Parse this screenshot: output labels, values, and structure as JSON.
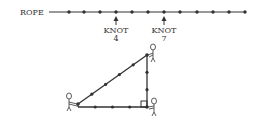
{
  "rope": {
    "label": "ROPE",
    "knot_count": 12,
    "knots_x": [
      69,
      84,
      100,
      116,
      132,
      148,
      164,
      180,
      197,
      213,
      229,
      245
    ]
  },
  "markers": [
    {
      "label": "KNOT",
      "number": "4",
      "x": 116
    },
    {
      "label": "KNOT",
      "number": "7",
      "x": 164
    }
  ],
  "triangle": {
    "vertices": {
      "left": [
        78,
        104
      ],
      "top": [
        147,
        55
      ],
      "right_angle": [
        147,
        107
      ]
    },
    "sides": {
      "base": 4,
      "height": 3,
      "hypotenuse": 5
    }
  },
  "colors": {
    "ink": "#333333",
    "background": "#ffffff"
  }
}
